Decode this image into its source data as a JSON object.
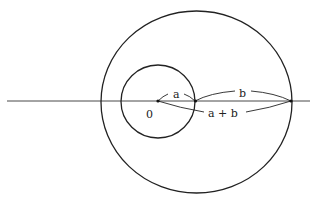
{
  "diagram": {
    "type": "geometric-construction",
    "axis": {
      "x1": 7,
      "y1": 101,
      "x2": 310,
      "y2": 101
    },
    "small_circle": {
      "cx": 158,
      "cy": 101,
      "r": 37
    },
    "large_circle": {
      "cx": 196.5,
      "cy": 102,
      "rx": 95.5,
      "ry": 91
    },
    "points": [
      {
        "name": "origin",
        "x": 158,
        "y": 101
      },
      {
        "name": "point-a",
        "x": 195,
        "y": 101
      },
      {
        "name": "point-a-plus-b",
        "x": 291,
        "y": 101
      }
    ],
    "labels": {
      "origin": "0",
      "a": "a",
      "b": "b",
      "a_plus_b": "a + b"
    },
    "stroke_color": "#222222",
    "background_color": "#ffffff"
  }
}
